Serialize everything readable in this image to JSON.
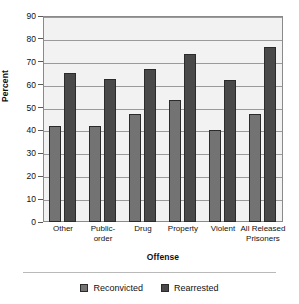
{
  "chart_data": {
    "type": "bar",
    "title": "",
    "xlabel": "Offense",
    "ylabel": "Percent",
    "categories": [
      "Other",
      "Public-order",
      "Drug",
      "Property",
      "Violent",
      "All Released Prisoners"
    ],
    "category_label_lines": [
      [
        "Other"
      ],
      [
        "Public-",
        "order"
      ],
      [
        "Drug"
      ],
      [
        "Property"
      ],
      [
        "Violent"
      ],
      [
        "All Released",
        "Prisoners"
      ]
    ],
    "series": [
      {
        "name": "Reconvicted",
        "color": "#737373",
        "values": [
          42,
          42,
          47,
          53.5,
          40,
          47
        ]
      },
      {
        "name": "Rearrested",
        "color": "#494949",
        "values": [
          65,
          62.5,
          67,
          73.5,
          62,
          76.5
        ]
      }
    ],
    "ylim": [
      0,
      90
    ],
    "yticks": [
      0,
      10,
      20,
      30,
      40,
      50,
      60,
      70,
      80,
      90
    ],
    "ytick_labels": [
      "0",
      "10",
      "20",
      "30",
      "40",
      "50",
      "60",
      "70",
      "80",
      "90"
    ],
    "grid": true,
    "legend_position": "bottom"
  }
}
